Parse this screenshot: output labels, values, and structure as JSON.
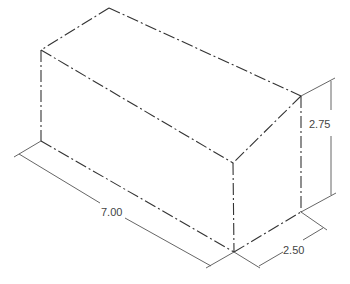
{
  "drawing": {
    "type": "isometric rectangular block",
    "line_style": "dash-dot (center/phantom lines)",
    "dimensions": {
      "length": "7.00",
      "width": "2.50",
      "height": "2.75"
    }
  },
  "colors": {
    "edge": "#333333",
    "dimension": "#555555",
    "text": "#444444",
    "background": "#ffffff"
  }
}
